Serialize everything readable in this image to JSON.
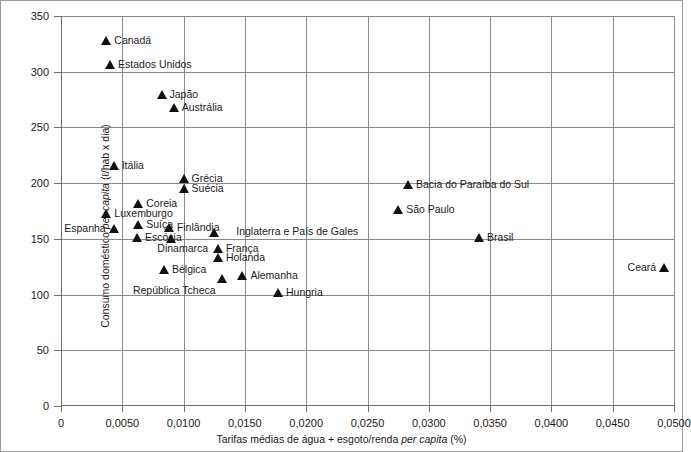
{
  "chart_data": {
    "type": "scatter",
    "title": "",
    "xlabel": "Tarifas médias de água + esgoto/renda per capita (%)",
    "xlabel_parts": {
      "pre": "Tarifas médias de água + esgoto/renda ",
      "italic": "per capita",
      "post": " (%)"
    },
    "ylabel": "Consumo doméstico per capita (ℓ/hab x dia)",
    "ylabel_parts": {
      "pre": "Consumo doméstico ",
      "italic": "per capita",
      "post": " (ℓ/hab x dia)"
    },
    "xlim": [
      0,
      0.05
    ],
    "ylim": [
      0,
      350
    ],
    "grid": true,
    "legend": false,
    "xticks": [
      0,
      0.005,
      0.01,
      0.015,
      0.02,
      0.025,
      0.03,
      0.035,
      0.04,
      0.045,
      0.05
    ],
    "xtick_labels": [
      "0",
      "0,0050",
      "0,0100",
      "0,0150",
      "0,0200",
      "0,0250",
      "0,0300",
      "0,0350",
      "0,0400",
      "0,0450",
      "0,0500"
    ],
    "yticks": [
      0,
      50,
      100,
      150,
      200,
      250,
      300,
      350
    ],
    "ytick_labels": [
      "0",
      "50",
      "100",
      "150",
      "200",
      "250",
      "300",
      "350"
    ],
    "marker_color": "#111111",
    "grid_color": "#8a8a8a",
    "points": [
      {
        "label": "Canadá",
        "x": 0.0037,
        "y": 328,
        "label_side": "right"
      },
      {
        "label": "Estados Unidos",
        "x": 0.004,
        "y": 306,
        "label_side": "right"
      },
      {
        "label": "Japão",
        "x": 0.0082,
        "y": 279,
        "label_side": "right"
      },
      {
        "label": "Austrália",
        "x": 0.0092,
        "y": 267,
        "label_side": "right"
      },
      {
        "label": "Itália",
        "x": 0.0043,
        "y": 215,
        "label_side": "right"
      },
      {
        "label": "Grécia",
        "x": 0.01,
        "y": 204,
        "label_side": "right"
      },
      {
        "label": "Suécia",
        "x": 0.01,
        "y": 195,
        "label_side": "right"
      },
      {
        "label": "Bacia do Paraíba do Sul",
        "x": 0.0283,
        "y": 198,
        "label_side": "right"
      },
      {
        "label": "São Paulo",
        "x": 0.0275,
        "y": 176,
        "label_side": "right"
      },
      {
        "label": "Coreia",
        "x": 0.0063,
        "y": 181,
        "label_side": "right"
      },
      {
        "label": "Luxemburgo",
        "x": 0.0037,
        "y": 172,
        "label_side": "right"
      },
      {
        "label": "Suíça",
        "x": 0.0063,
        "y": 162,
        "label_side": "right"
      },
      {
        "label": "Finlândia",
        "x": 0.0088,
        "y": 160,
        "label_side": "right"
      },
      {
        "label": "Espanha",
        "x": 0.0043,
        "y": 159,
        "label_side": "left"
      },
      {
        "label": "Escócia",
        "x": 0.0062,
        "y": 151,
        "label_side": "right"
      },
      {
        "label": "Dinamarca",
        "x": 0.009,
        "y": 150,
        "label_side": "below"
      },
      {
        "label": "Inglaterra e País de Gales",
        "x": 0.0125,
        "y": 155,
        "label_side": "right-far"
      },
      {
        "label": "França",
        "x": 0.0128,
        "y": 141,
        "label_side": "right"
      },
      {
        "label": "Holanda",
        "x": 0.0128,
        "y": 133,
        "label_side": "right"
      },
      {
        "label": "Brasil",
        "x": 0.0341,
        "y": 151,
        "label_side": "right"
      },
      {
        "label": "Bélgica",
        "x": 0.0084,
        "y": 122,
        "label_side": "right"
      },
      {
        "label": "Alemanha",
        "x": 0.0148,
        "y": 117,
        "label_side": "right"
      },
      {
        "label": "República Tcheca",
        "x": 0.0131,
        "y": 114,
        "label_side": "below-left"
      },
      {
        "label": "Ceará",
        "x": 0.0492,
        "y": 124,
        "label_side": "left"
      },
      {
        "label": "Hungria",
        "x": 0.0177,
        "y": 101,
        "label_side": "right"
      }
    ]
  }
}
